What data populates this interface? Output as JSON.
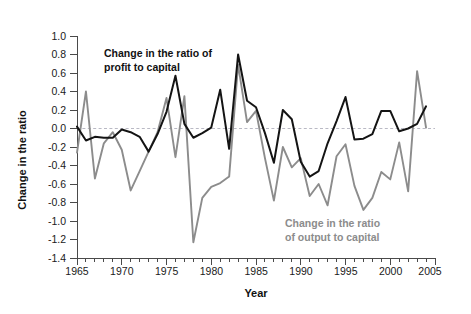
{
  "chart_data": {
    "type": "line",
    "title": "",
    "xlabel": "Year",
    "ylabel": "Change in the ratio",
    "xlim": [
      1965,
      2005
    ],
    "ylim": [
      -1.4,
      1.0
    ],
    "grid": false,
    "legend_position": "inline-annotations",
    "zero_reference_line": 0.0,
    "y_ticks": [
      1.0,
      0.8,
      0.6,
      0.4,
      0.2,
      0.0,
      -0.2,
      -0.4,
      -0.6,
      -0.8,
      -1.0,
      -1.2,
      -1.4
    ],
    "y_tick_labels": [
      "1.0",
      "0.8",
      "0.6",
      "0.4",
      "0.2",
      "0.0",
      "-0.2",
      "-0.4",
      "-0.6",
      "-0.8",
      "-1.0",
      "-1.2",
      "-1.4"
    ],
    "x_ticks": [
      1965,
      1970,
      1975,
      1980,
      1985,
      1990,
      1995,
      2000,
      2005
    ],
    "x_tick_labels": [
      "1965",
      "1970",
      "1975",
      "1980",
      "1985",
      "1990",
      "1995",
      "2000",
      "2005"
    ],
    "x_minor_tick_interval": 1,
    "x": [
      1965,
      1966,
      1967,
      1968,
      1969,
      1970,
      1971,
      1972,
      1973,
      1974,
      1975,
      1976,
      1977,
      1978,
      1979,
      1980,
      1981,
      1982,
      1983,
      1984,
      1985,
      1986,
      1987,
      1988,
      1989,
      1990,
      1991,
      1992,
      1993,
      1994,
      1995,
      1996,
      1997,
      1998,
      1999,
      2000,
      2001,
      2002,
      2003,
      2004
    ],
    "series": [
      {
        "name": "Change in the ratio of profit to capital",
        "color": "#141414",
        "values": [
          0.02,
          -0.13,
          -0.09,
          -0.1,
          -0.1,
          -0.01,
          -0.04,
          -0.09,
          -0.25,
          -0.06,
          0.18,
          0.57,
          0.05,
          -0.1,
          -0.05,
          0.01,
          0.42,
          -0.22,
          0.8,
          0.3,
          0.23,
          -0.05,
          -0.37,
          0.2,
          0.1,
          -0.36,
          -0.52,
          -0.46,
          -0.16,
          0.08,
          0.34,
          -0.12,
          -0.11,
          -0.06,
          0.19,
          0.19,
          -0.03,
          0.0,
          0.05,
          0.24
        ]
      },
      {
        "name": "Change in the ratio of output to capital",
        "color": "#8c8c8c",
        "values": [
          -0.26,
          0.4,
          -0.54,
          -0.16,
          -0.04,
          -0.23,
          -0.67,
          -0.46,
          -0.25,
          -0.04,
          0.33,
          -0.31,
          0.35,
          -1.23,
          -0.75,
          -0.63,
          -0.59,
          -0.52,
          0.69,
          0.07,
          0.19,
          -0.32,
          -0.78,
          -0.2,
          -0.42,
          -0.32,
          -0.73,
          -0.6,
          -0.83,
          -0.3,
          -0.17,
          -0.62,
          -0.88,
          -0.75,
          -0.47,
          -0.55,
          -0.15,
          -0.68,
          0.62,
          0.01
        ]
      }
    ],
    "annotations": [
      {
        "id": "profit-annotation",
        "line1": "Change in the ratio of",
        "line2": "profit to capital",
        "color": "#111111"
      },
      {
        "id": "output-annotation",
        "line1": "Change in the ratio",
        "line2": "of output to capital",
        "color": "#8c8c8c"
      }
    ]
  },
  "labels": {
    "y_axis_title": "Change in the ratio",
    "x_axis_title": "Year",
    "profit_line1": "Change in the ratio of",
    "profit_line2": "profit to capital",
    "output_line1": "Change in the ratio",
    "output_line2": "of output to capital"
  },
  "y_tick_text": {
    "t0": "1.0",
    "t1": "0.8",
    "t2": "0.6",
    "t3": "0.4",
    "t4": "0.2",
    "t5": "0.0",
    "t6": "-0.2",
    "t7": "-0.4",
    "t8": "-0.6",
    "t9": "-0.8",
    "t10": "-1.0",
    "t11": "-1.2",
    "t12": "-1.4"
  },
  "x_tick_text": {
    "t0": "1965",
    "t1": "1970",
    "t2": "1975",
    "t3": "1980",
    "t4": "1985",
    "t5": "1990",
    "t6": "1995",
    "t7": "2000",
    "t8": "2005"
  },
  "colors": {
    "profit": "#141414",
    "output": "#8c8c8c",
    "axis": "#4a4a4a",
    "zero_line": "#b9b9c4",
    "background": "#ffffff"
  }
}
